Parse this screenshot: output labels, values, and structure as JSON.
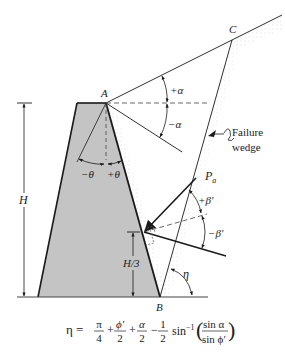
{
  "figure": {
    "type": "retaining-wall-failure-wedge-diagram",
    "colors": {
      "wall_fill": "#c4c4c4",
      "line": "#1a1a1a",
      "dashed": "#555555",
      "backfill_stipple": "#d8d8d8"
    },
    "points": {
      "A": "A",
      "B": "B",
      "C": "C"
    },
    "labels": {
      "plus_alpha": "+α",
      "minus_alpha": "−α",
      "minus_theta": "−θ",
      "plus_theta": "+θ",
      "H": "H",
      "H_third": "H/3",
      "Pa_main": "P",
      "Pa_sub": "a",
      "plus_beta": "+β′",
      "minus_beta": "−β′",
      "eta": "η",
      "failure_wedge_line1": "Failure",
      "failure_wedge_line2": "wedge"
    },
    "equation": {
      "lhs": "η =",
      "t1_num": "π",
      "t1_den": "4",
      "op1": "+",
      "t2_num": "ϕ′",
      "t2_den": "2",
      "op2": "+",
      "t3_num": "α",
      "t3_den": "2",
      "op3": "−",
      "t4_num": "1",
      "t4_den": "2",
      "func": "sin",
      "func_sup": "−1",
      "arg_num": "sin α",
      "arg_den": "sin ϕ′"
    }
  }
}
